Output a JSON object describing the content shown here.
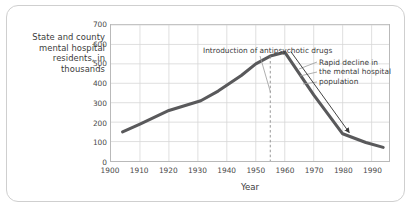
{
  "chart_data": {
    "type": "line",
    "title": "",
    "xlabel": "Year",
    "ylabel": "State and county mental hospital residents, in thousands",
    "ylabel_lines": [
      "State and county",
      "mental hospital",
      "residents, in",
      "thousands"
    ],
    "xlim": [
      1900,
      1996
    ],
    "ylim": [
      0,
      700
    ],
    "grid": true,
    "legend": "none",
    "x_ticks": [
      1900,
      1910,
      1920,
      1930,
      1940,
      1950,
      1960,
      1970,
      1980,
      1990
    ],
    "x_tick_labels": [
      "1900",
      "1910",
      "1920",
      "1930",
      "1940",
      "1950",
      "1960",
      "1970",
      "1980",
      "1990"
    ],
    "y_ticks": [
      0,
      100,
      200,
      300,
      400,
      500,
      600,
      700
    ],
    "y_tick_labels": [
      "0",
      "100",
      "200",
      "300",
      "400",
      "500",
      "600",
      "700"
    ],
    "series": [
      {
        "name": "State and county mental hospital residents",
        "color": "#59595b",
        "x": [
          1904,
          1910,
          1920,
          1931,
          1937,
          1945,
          1950,
          1955,
          1960,
          1970,
          1980,
          1988,
          1994
        ],
        "values": [
          150,
          190,
          260,
          310,
          360,
          440,
          500,
          540,
          560,
          340,
          140,
          95,
          70
        ]
      }
    ],
    "annotations": [
      {
        "id": "introduction-of-antipsychotic-drugs",
        "lines": [
          "Introduction of antipsychotic drugs"
        ],
        "marker_year": 1955,
        "marker_style": "dashed-vertical"
      },
      {
        "id": "rapid-decline",
        "lines": [
          "Rapid decline in",
          "the mental hospital",
          "population"
        ],
        "marker_style": "arrow",
        "arrow_from_year": 1962,
        "arrow_to_year": 1982
      }
    ]
  }
}
